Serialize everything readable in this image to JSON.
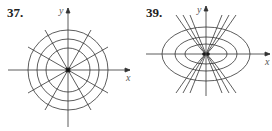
{
  "figures": [
    {
      "number": "37.",
      "x_label": "x",
      "y_label": "y",
      "description": "Concentric circles with radial lines through origin"
    },
    {
      "number": "39.",
      "x_label": "x",
      "y_label": "y",
      "description": "Concentric ellipses with orthogonal curves through origin"
    }
  ]
}
